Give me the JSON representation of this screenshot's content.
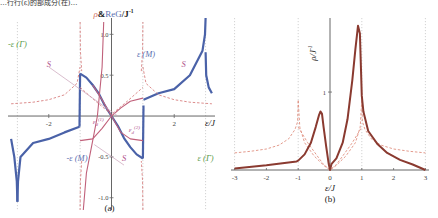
{
  "top_caption": "…行行(ε)的部成分(在)…",
  "chart_data": [
    {
      "panel": "(a)",
      "type": "line",
      "title": "",
      "ylabel": "ρ&ReG/J⁻¹",
      "ylabel_rho": "ρ",
      "ylabel_rest": "&ReG/J",
      "ylabel_sup": "-1",
      "xlabel": "ε/J",
      "xlim": [
        -3.3,
        3.3
      ],
      "ylim": [
        -1.15,
        1.2
      ],
      "xticks": [
        -2,
        2
      ],
      "xtick_labels": [
        "-2",
        "2"
      ],
      "yticks": [
        1.0,
        0.5,
        -0.5,
        -1.0
      ],
      "ytick_labels": [
        "1.0",
        "0.5",
        "-0.5",
        "-1.0"
      ],
      "vertical_dotted_lines": [
        -3,
        -1,
        1,
        3
      ],
      "annotations": [
        {
          "text": "-ε (Γ)",
          "x": -3,
          "y": 0.85,
          "color": "#5a9a4a"
        },
        {
          "text": "ε (M)",
          "x": 1.1,
          "y": 0.72,
          "color": "#5b6fb0"
        },
        {
          "text": "-ε (M)",
          "x": -1.1,
          "y": -0.55,
          "color": "#5b6fb0"
        },
        {
          "text": "ε (Γ)",
          "x": 3,
          "y": -0.55,
          "color": "#5a9a4a"
        },
        {
          "text": "S",
          "x": -2.0,
          "y": 0.6,
          "color": "#b0508a"
        },
        {
          "text": "S",
          "x": 2.3,
          "y": 0.6,
          "color": "#b0508a"
        },
        {
          "text": "S",
          "x": 0.4,
          "y": -0.55,
          "color": "#b0508a"
        },
        {
          "text": "ε_d^(1)",
          "x": -0.6,
          "y": -0.1,
          "color": "#b0508a"
        },
        {
          "text": "ε_d^(2)",
          "x": 0.55,
          "y": -0.2,
          "color": "#b0508a"
        }
      ],
      "series": [
        {
          "name": "ReG (solid blue)",
          "color": "#4a62a8",
          "style": "solid",
          "segments": [
            {
              "x": [
                -3.2,
                -3.1,
                -3.02,
                -3.0
              ],
              "y": [
                -0.28,
                -0.5,
                -0.8,
                -1.05
              ]
            },
            {
              "x": [
                -3.0,
                -2.98,
                -2.9,
                -2.5,
                -2.0,
                -1.5,
                -1.02
              ],
              "y": [
                -1.05,
                -0.8,
                -0.5,
                -0.33,
                -0.28,
                -0.2,
                -0.13
              ]
            },
            {
              "x": [
                -1.02,
                -1.0
              ],
              "y": [
                -0.13,
                0.52
              ]
            },
            {
              "x": [
                -1.0,
                -0.8,
                -0.6,
                -0.4,
                -0.2,
                0.0
              ],
              "y": [
                0.52,
                0.47,
                0.38,
                0.27,
                0.12,
                0.0
              ]
            },
            {
              "x": [
                0.0,
                0.2,
                0.4,
                0.6,
                0.8,
                1.0
              ],
              "y": [
                0.0,
                -0.12,
                -0.27,
                -0.38,
                -0.47,
                -0.52
              ]
            },
            {
              "x": [
                1.0,
                1.02
              ],
              "y": [
                -0.52,
                0.13
              ]
            },
            {
              "x": [
                1.02,
                1.5,
                2.0,
                2.5,
                2.9,
                2.98,
                3.0
              ],
              "y": [
                0.2,
                0.28,
                0.33,
                0.5,
                0.8,
                1.0,
                1.2
              ]
            },
            {
              "x": [
                3.0,
                3.02,
                3.1,
                3.2
              ],
              "y": [
                0.78,
                0.5,
                0.35,
                0.28
              ]
            }
          ]
        },
        {
          "name": "ρ / S curves (dashed red)",
          "color": "#d88080",
          "style": "dashed",
          "segments": [
            {
              "x": [
                -3.2,
                -2.5,
                -2.0,
                -1.5,
                -1.1,
                -1.0
              ],
              "y": [
                0.15,
                0.17,
                0.2,
                0.26,
                0.4,
                0.6
              ]
            },
            {
              "x": [
                -1.0,
                -0.99,
                -0.95
              ],
              "y": [
                1.15,
                0.8,
                0.55
              ]
            },
            {
              "x": [
                1.0,
                1.1,
                1.5,
                2.0,
                2.5,
                3.2
              ],
              "y": [
                0.6,
                0.4,
                0.26,
                0.2,
                0.17,
                0.15
              ]
            },
            {
              "x": [
                0.95,
                0.99,
                1.0
              ],
              "y": [
                0.55,
                0.8,
                1.15
              ]
            },
            {
              "x": [
                -1.0,
                -0.5,
                0.0,
                0.5,
                1.0
              ],
              "y": [
                0.35,
                0.18,
                0.02,
                0.18,
                0.35
              ]
            },
            {
              "x": [
                -0.95,
                -0.99,
                -1.0
              ],
              "y": [
                -0.55,
                -0.8,
                -1.15
              ]
            },
            {
              "x": [
                1.0,
                0.99,
                0.95
              ],
              "y": [
                -1.15,
                -0.8,
                -0.55
              ]
            }
          ]
        },
        {
          "name": "S (solid pink)",
          "color": "#c0607a",
          "style": "solid",
          "segments": [
            {
              "x": [
                -0.9,
                -0.8,
                -0.6,
                -0.45
              ],
              "y": [
                -1.15,
                -0.7,
                -0.3,
                0.0
              ]
            },
            {
              "x": [
                -0.45,
                -0.3,
                -0.25
              ],
              "y": [
                0.0,
                0.6,
                1.15
              ]
            },
            {
              "x": [
                -0.6,
                -0.3,
                0.0,
                0.3,
                0.6,
                1.0
              ],
              "y": [
                0.38,
                0.2,
                0.0,
                -0.2,
                -0.28,
                -0.3
              ]
            },
            {
              "x": [
                -1.0,
                -0.6,
                -0.3,
                0.0
              ],
              "y": [
                -0.3,
                -0.28,
                -0.15,
                0.0
              ]
            },
            {
              "x": [
                0.0,
                0.3,
                0.6,
                1.0
              ],
              "y": [
                0.0,
                0.1,
                0.18,
                0.22
              ]
            }
          ]
        },
        {
          "name": "S guide (thin mauve)",
          "color": "#c8a0b8",
          "style": "solid",
          "segments": [
            {
              "x": [
                -2.0,
                0.2
              ],
              "y": [
                0.6,
                0.0
              ]
            },
            {
              "x": [
                0.4,
                -0.55
              ],
              "y": [
                -0.6,
                -0.35
              ]
            }
          ]
        }
      ]
    },
    {
      "panel": "(b)",
      "type": "line",
      "title": "",
      "ylabel": "ρ/J⁻¹",
      "ylabel_rho": "ρ",
      "ylabel_rest": "/J",
      "ylabel_sup": "-1",
      "xlabel": "ε/J",
      "xlim": [
        -3.05,
        3.05
      ],
      "ylim": [
        0,
        1.95
      ],
      "xticks": [
        -3,
        -2,
        -1,
        0,
        1,
        2,
        3
      ],
      "xtick_labels": [
        "-3",
        "-2",
        "-1",
        "0",
        "1",
        "2",
        "3"
      ],
      "yticks": [
        1
      ],
      "ytick_labels": [
        "1"
      ],
      "vertical_dotted_lines": [
        -3,
        -1,
        1,
        3
      ],
      "series": [
        {
          "name": "ρ total (solid brown)",
          "color": "#8a3a30",
          "style": "solid",
          "x": [
            -3.0,
            -2.0,
            -1.05,
            -1.0,
            -0.8,
            -0.6,
            -0.45,
            -0.35,
            -0.3,
            -0.25,
            -0.2,
            -0.12,
            -0.04,
            0.0,
            0.05,
            0.2,
            0.4,
            0.55,
            0.7,
            0.8,
            0.88,
            0.94,
            1.0,
            1.05,
            1.2,
            1.5,
            1.8,
            2.2,
            2.6,
            3.0
          ],
          "y": [
            0.02,
            0.06,
            0.11,
            0.12,
            0.2,
            0.35,
            0.55,
            0.7,
            0.75,
            0.72,
            0.55,
            0.3,
            0.08,
            0.0,
            0.08,
            0.15,
            0.35,
            0.65,
            1.15,
            1.55,
            1.85,
            1.75,
            0.95,
            0.75,
            0.5,
            0.33,
            0.22,
            0.13,
            0.07,
            0.0
          ]
        },
        {
          "name": "ρ component 1 (dashed)",
          "color": "#e09080",
          "style": "dashed",
          "x": [
            -3.0,
            -2.5,
            -2.0,
            -1.6,
            -1.3,
            -1.1,
            -1.02,
            -1.0,
            -0.95,
            -0.8,
            -0.5,
            -0.2,
            0.0,
            0.2,
            0.5,
            0.8,
            0.95,
            1.0,
            1.02,
            1.1,
            1.3,
            1.6,
            2.0,
            2.5,
            3.0
          ],
          "y": [
            0.22,
            0.24,
            0.27,
            0.32,
            0.4,
            0.52,
            0.62,
            0.9,
            0.55,
            0.35,
            0.18,
            0.06,
            0.0,
            0.06,
            0.18,
            0.35,
            0.55,
            0.9,
            0.62,
            0.52,
            0.4,
            0.32,
            0.27,
            0.24,
            0.22
          ]
        },
        {
          "name": "ρ component 2 (dashed)",
          "color": "#e09080",
          "style": "dashed",
          "x": [
            -1.0,
            -0.7,
            -0.4,
            -0.2,
            0.0,
            0.2,
            0.4,
            0.7,
            1.0
          ],
          "y": [
            0.55,
            0.35,
            0.18,
            0.07,
            0.0,
            0.07,
            0.18,
            0.35,
            0.55
          ]
        }
      ]
    }
  ]
}
